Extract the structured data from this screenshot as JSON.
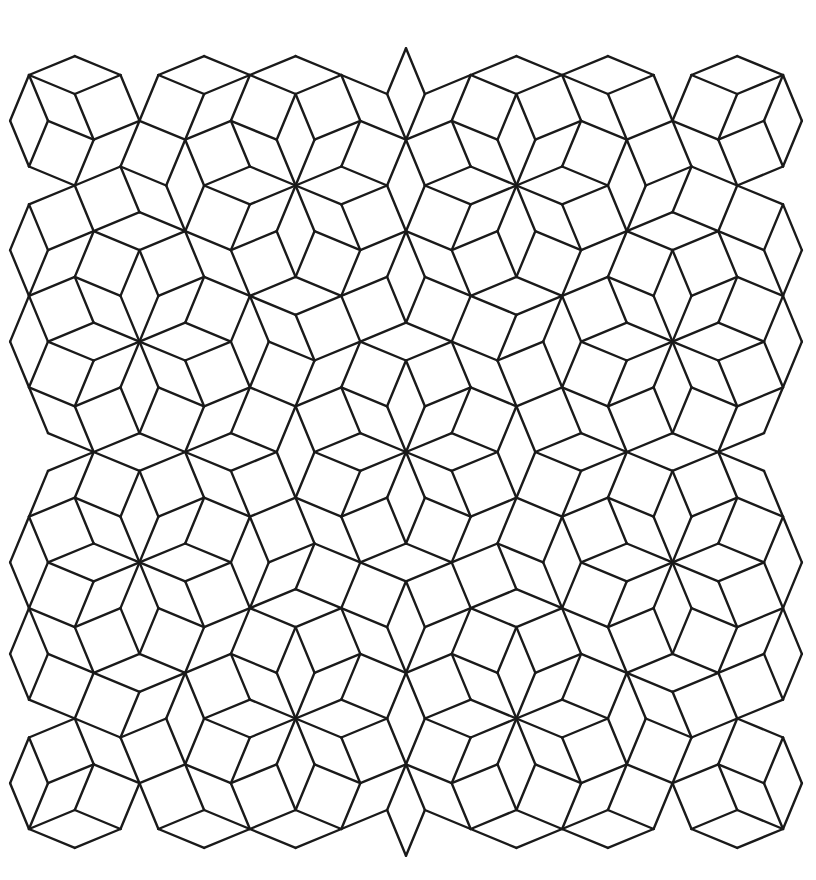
{
  "figure": {
    "kind": "ammann-beenker-tiling",
    "tiles": [
      "square",
      "rhombus-45"
    ],
    "symmetry_center": [
      406,
      452
    ],
    "edge_length": 49.5,
    "orientation_offset_deg": 22.5,
    "bounds": {
      "x_min": 5,
      "x_max": 806,
      "y_min": 42,
      "y_max": 863
    },
    "colors": {
      "background": "#ffffff",
      "line": "#1a1a1a"
    },
    "line_width": 2.4
  }
}
